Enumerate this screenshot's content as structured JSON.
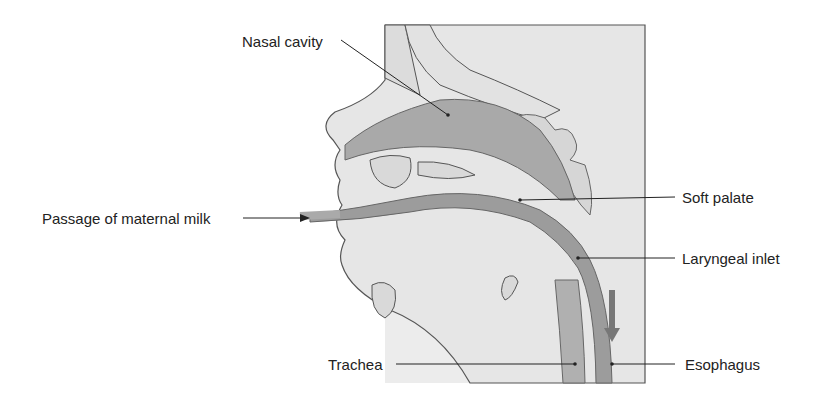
{
  "diagram": {
    "labels": {
      "nasal_cavity": "Nasal cavity",
      "passage_of_maternal_milk": "Passage of maternal milk",
      "soft_palate": "Soft palate",
      "laryngeal_inlet": "Laryngeal inlet",
      "trachea": "Trachea",
      "esophagus": "Esophagus"
    },
    "colors": {
      "background_panel": "#ececec",
      "tissue_fill": "#e6e6e6",
      "cavity_fill": "#a9a9a9",
      "passage_fill": "#9c9c9c",
      "outline": "#555555",
      "leader_line": "#222222"
    }
  }
}
